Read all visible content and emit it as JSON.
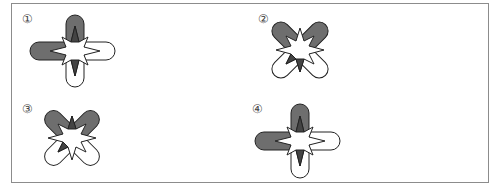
{
  "colors": {
    "lobe_dark": "#6e6e6e",
    "lobe_light": "#ffffff",
    "stroke": "#222222",
    "frame": "#8c8c8c"
  },
  "options": [
    {
      "label": "①",
      "shape": "plus",
      "dark_lobes": [
        "top",
        "left"
      ],
      "dark_spikes": [
        "top",
        "bottom"
      ]
    },
    {
      "label": "②",
      "shape": "x",
      "dark_lobes": [
        "top-left",
        "top-right"
      ],
      "dark_spikes": [
        "bottom-left"
      ]
    },
    {
      "label": "③",
      "shape": "x",
      "dark_lobes": [
        "top-left",
        "top-right"
      ],
      "dark_spikes": [
        "bottom-left"
      ]
    },
    {
      "label": "④",
      "shape": "plus",
      "dark_lobes": [
        "top",
        "left"
      ],
      "dark_spikes": [
        "top",
        "bottom"
      ]
    }
  ]
}
